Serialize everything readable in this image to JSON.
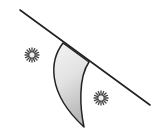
{
  "diagram": {
    "description": "Diagonal line with a curved horn/crescent-shaped surface hanging below it, flanked by two small star/sun symbols",
    "colors": {
      "stroke": "#222222",
      "fill_light": "#f2f2f2",
      "fill_dark": "#bdbdbd",
      "background": "#ffffff"
    },
    "line": {
      "x1": 20,
      "y1": 10,
      "x2": 150,
      "y2": 105
    },
    "crescent": {
      "top_left": [
        63,
        43
      ],
      "top_right": [
        89,
        62
      ],
      "tip": [
        84,
        127
      ]
    },
    "stars": [
      {
        "name": "star-left",
        "cx": 32,
        "cy": 55,
        "r": 6
      },
      {
        "name": "star-right",
        "cx": 101,
        "cy": 98,
        "r": 6
      }
    ]
  }
}
